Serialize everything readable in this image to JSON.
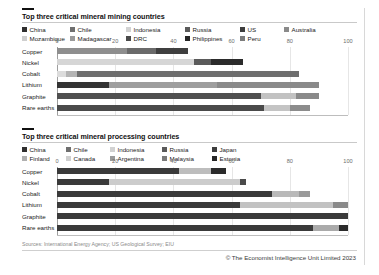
{
  "chart_data": [
    {
      "type": "bar",
      "orientation": "horizontal",
      "stacked": true,
      "title": "Top three critical mineral mining countries",
      "xlabel": "",
      "ylabel": "",
      "xlim": [
        0,
        100
      ],
      "xticks": [
        0,
        20,
        40,
        60,
        80,
        100
      ],
      "xtick_labels": [
        "0",
        "20",
        "40",
        "60",
        "80",
        "100"
      ],
      "grid": true,
      "legend_position": "top",
      "categories": [
        "Copper",
        "Nickel",
        "Cobalt",
        "Lithium",
        "Graphite",
        "Rare earths"
      ],
      "legend": [
        {
          "name": "China",
          "color": "#2f2f2f"
        },
        {
          "name": "Chile",
          "color": "#6f6f6f"
        },
        {
          "name": "Indonesia",
          "color": "#d2d2d2"
        },
        {
          "name": "Russia",
          "color": "#5a5a5a"
        },
        {
          "name": "US",
          "color": "#3d3d3d"
        },
        {
          "name": "Australia",
          "color": "#8a8a8a"
        },
        {
          "name": "Mozambique",
          "color": "#cfcfcf"
        },
        {
          "name": "Madagascar",
          "color": "#9a9a9a"
        },
        {
          "name": "DRC",
          "color": "#4a4a4a"
        },
        {
          "name": "Philippines",
          "color": "#262626"
        },
        {
          "name": "Peru",
          "color": "#7c7c7c"
        }
      ],
      "bars": [
        {
          "category": "Copper",
          "segments": [
            {
              "name": "Chile",
              "value": 24,
              "color": "#8e8e8e"
            },
            {
              "name": "Peru",
              "value": 10,
              "color": "#6a6a6a"
            },
            {
              "name": "China",
              "value": 11,
              "color": "#3f3f3f"
            }
          ],
          "total": 45
        },
        {
          "category": "Nickel",
          "segments": [
            {
              "name": "Indonesia",
              "value": 47,
              "color": "#d6d6d6"
            },
            {
              "name": "Philippines",
              "value": 6,
              "color": "#5a5a5a"
            },
            {
              "name": "Russia",
              "value": 11,
              "color": "#2b2b2b"
            }
          ],
          "total": 64
        },
        {
          "category": "Cobalt",
          "segments": [
            {
              "name": "Indonesia",
              "value": 3,
              "color": "#dcdcdc"
            },
            {
              "name": "Australia",
              "value": 4,
              "color": "#b4b4b4"
            },
            {
              "name": "DRC",
              "value": 76,
              "color": "#6e6e6e"
            }
          ],
          "total": 83
        },
        {
          "category": "Lithium",
          "segments": [
            {
              "name": "Australia",
              "value": 18,
              "color": "#333333"
            },
            {
              "name": "Chile",
              "value": 37,
              "color": "#9e9e9e"
            },
            {
              "name": "China",
              "value": 35,
              "color": "#8a8a8a"
            }
          ],
          "total": 90
        },
        {
          "category": "Graphite",
          "segments": [
            {
              "name": "China",
              "value": 70,
              "color": "#4f4f4f"
            },
            {
              "name": "Mozambique",
              "value": 12,
              "color": "#c2c2c2"
            },
            {
              "name": "Madagascar",
              "value": 8,
              "color": "#8a8a8a"
            }
          ],
          "total": 90
        },
        {
          "category": "Rare earths",
          "segments": [
            {
              "name": "China",
              "value": 71,
              "color": "#4a4a4a"
            },
            {
              "name": "US",
              "value": 9,
              "color": "#c4c4c4"
            },
            {
              "name": "Australia",
              "value": 7,
              "color": "#8c8c8c"
            }
          ],
          "total": 87
        }
      ]
    },
    {
      "type": "bar",
      "orientation": "horizontal",
      "stacked": true,
      "title": "Top three critical mineral processing countries",
      "xlabel": "",
      "ylabel": "",
      "xlim": [
        0,
        100
      ],
      "xticks": [
        0,
        20,
        40,
        60,
        80,
        100
      ],
      "xtick_labels": [
        "0",
        "20",
        "40",
        "60",
        "80",
        "100"
      ],
      "grid": true,
      "legend_position": "top",
      "categories": [
        "Copper",
        "Nickel",
        "Cobalt",
        "Lithium",
        "Graphite",
        "Rare earths"
      ],
      "legend": [
        {
          "name": "China",
          "color": "#2f2f2f"
        },
        {
          "name": "Chile",
          "color": "#6f6f6f"
        },
        {
          "name": "Indonesia",
          "color": "#d2d2d2"
        },
        {
          "name": "Russia",
          "color": "#5a5a5a"
        },
        {
          "name": "Japan",
          "color": "#3d3d3d"
        },
        {
          "name": "Finland",
          "color": "#b0b0b0"
        },
        {
          "name": "Canada",
          "color": "#cfcfcf"
        },
        {
          "name": "Argentina",
          "color": "#9a9a9a"
        },
        {
          "name": "Malaysia",
          "color": "#7a7a7a"
        },
        {
          "name": "Estonia",
          "color": "#262626"
        }
      ],
      "bars": [
        {
          "category": "Copper",
          "segments": [
            {
              "name": "China",
              "value": 42,
              "color": "#3a3a3a"
            },
            {
              "name": "Chile",
              "value": 11,
              "color": "#bdbdbd"
            },
            {
              "name": "Japan",
              "value": 5,
              "color": "#2b2b2b"
            }
          ],
          "total": 58
        },
        {
          "category": "Nickel",
          "segments": [
            {
              "name": "China",
              "value": 18,
              "color": "#3a3a3a"
            },
            {
              "name": "Indonesia",
              "value": 45,
              "color": "#cccccc"
            },
            {
              "name": "Finland",
              "value": 2,
              "color": "#4a4a4a"
            }
          ],
          "total": 65
        },
        {
          "category": "Cobalt",
          "segments": [
            {
              "name": "China",
              "value": 74,
              "color": "#3a3a3a"
            },
            {
              "name": "Finland",
              "value": 9,
              "color": "#b9b9b9"
            },
            {
              "name": "Canada",
              "value": 4,
              "color": "#9a9a9a"
            }
          ],
          "total": 87
        },
        {
          "category": "Lithium",
          "segments": [
            {
              "name": "China",
              "value": 63,
              "color": "#3a3a3a"
            },
            {
              "name": "Chile",
              "value": 32,
              "color": "#c2c2c2"
            },
            {
              "name": "Argentina",
              "value": 5,
              "color": "#8a8a8a"
            }
          ],
          "total": 100
        },
        {
          "category": "Graphite",
          "segments": [
            {
              "name": "China",
              "value": 100,
              "color": "#3a3a3a"
            }
          ],
          "total": 100
        },
        {
          "category": "Rare earths",
          "segments": [
            {
              "name": "China",
              "value": 88,
              "color": "#3a3a3a"
            },
            {
              "name": "Malaysia",
              "value": 9,
              "color": "#aaaaaa"
            },
            {
              "name": "Estonia",
              "value": 3,
              "color": "#2b2b2b"
            }
          ],
          "total": 100
        }
      ]
    }
  ],
  "footer": {
    "source": "Sources: International Energy Agency; US Geological Survey; EIU",
    "copyright": "© The Economist Intelligence Unit Limited 2023"
  }
}
